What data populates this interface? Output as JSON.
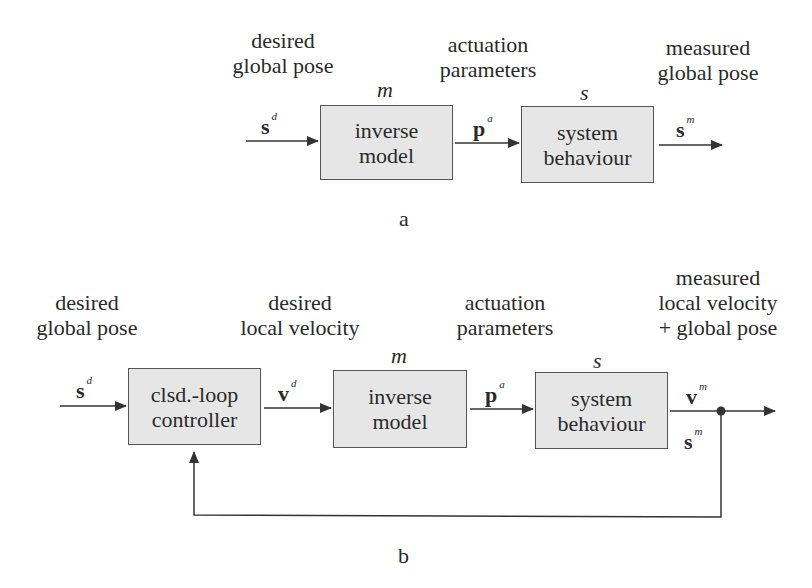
{
  "diagram_a": {
    "caption": "a",
    "input_label": [
      "desired",
      "global pose"
    ],
    "middle_label": [
      "actuation",
      "parameters"
    ],
    "output_label": [
      "measured",
      "global pose"
    ],
    "blocks": [
      {
        "symbol": "m",
        "lines": [
          "inverse",
          "model"
        ]
      },
      {
        "symbol": "s",
        "lines": [
          "system",
          "behaviour"
        ]
      }
    ],
    "signals": {
      "input": {
        "base": "s",
        "sup": "d"
      },
      "middle": {
        "base": "p",
        "sup": "a"
      },
      "output": {
        "base": "s",
        "sup": "m"
      }
    }
  },
  "diagram_b": {
    "caption": "b",
    "input_label": [
      "desired",
      "global pose"
    ],
    "second_label": [
      "desired",
      "local velocity"
    ],
    "third_label": [
      "actuation",
      "parameters"
    ],
    "output_label": [
      "measured",
      "local velocity",
      "+ global pose"
    ],
    "blocks": [
      {
        "symbol": "",
        "lines": [
          "clsd.-loop",
          "controller"
        ]
      },
      {
        "symbol": "m",
        "lines": [
          "inverse",
          "model"
        ]
      },
      {
        "symbol": "s",
        "lines": [
          "system",
          "behaviour"
        ]
      }
    ],
    "signals": {
      "input": {
        "base": "s",
        "sup": "d"
      },
      "velocity_cmd": {
        "base": "v",
        "sup": "d"
      },
      "actuation": {
        "base": "p",
        "sup": "a"
      },
      "velocity_out": {
        "base": "v",
        "sup": "m"
      },
      "pose_out": {
        "base": "s",
        "sup": "m"
      }
    }
  },
  "colors": {
    "block_fill": "#e6e6e6",
    "line": "#333333",
    "text": "#2a2a2a"
  }
}
